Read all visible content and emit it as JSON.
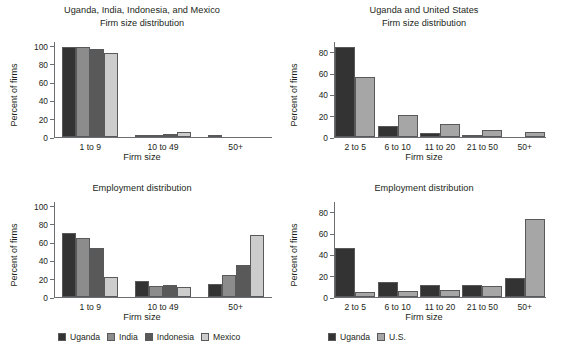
{
  "colors": {
    "uganda": "#333333",
    "india": "#8c8c8c",
    "indonesia": "#595959",
    "mexico": "#cccccc",
    "us": "#a6a6a6",
    "axis": "#6d6e71",
    "text": "#231f20",
    "background": "#ffffff"
  },
  "legends": {
    "four_country": {
      "items": [
        {
          "label": "Uganda",
          "color": "#333333"
        },
        {
          "label": "India",
          "color": "#8c8c8c"
        },
        {
          "label": "Indonesia",
          "color": "#595959"
        },
        {
          "label": "Mexico",
          "color": "#cccccc"
        }
      ]
    },
    "two_country": {
      "items": [
        {
          "label": "Uganda",
          "color": "#333333"
        },
        {
          "label": "U.S.",
          "color": "#a6a6a6"
        }
      ]
    }
  },
  "chart_data": [
    {
      "id": "top-left",
      "type": "bar",
      "title": "Uganda, India, Indonesia, and Mexico",
      "subtitle": "Firm size distribution",
      "xlabel": "Firm size",
      "ylabel": "Percent of firms",
      "ylim": [
        0,
        105
      ],
      "yticks": [
        0,
        20,
        40,
        60,
        80,
        100
      ],
      "grid": false,
      "legend_position": "bottom",
      "categories": [
        "1 to 9",
        "10 to 49",
        "50+"
      ],
      "series": [
        {
          "name": "Uganda",
          "color": "#333333",
          "values": [
            98,
            1.2,
            1.5
          ]
        },
        {
          "name": "India",
          "color": "#8c8c8c",
          "values": [
            98,
            1.2,
            0
          ]
        },
        {
          "name": "Indonesia",
          "color": "#595959",
          "values": [
            96,
            3,
            0
          ]
        },
        {
          "name": "Mexico",
          "color": "#cccccc",
          "values": [
            92,
            6,
            0
          ]
        }
      ]
    },
    {
      "id": "top-right",
      "type": "bar",
      "title": "Uganda and United States",
      "subtitle": "Firm size distribution",
      "xlabel": "Firm size",
      "ylabel": "Percent of firms",
      "ylim": [
        0,
        90
      ],
      "yticks": [
        0,
        20,
        40,
        60,
        80
      ],
      "grid": false,
      "legend_position": "bottom",
      "categories": [
        "2 to 5",
        "6 to 10",
        "11 to 20",
        "21 to 50",
        "50+"
      ],
      "series": [
        {
          "name": "Uganda",
          "color": "#333333",
          "values": [
            84,
            10,
            3.5,
            1.5,
            0
          ]
        },
        {
          "name": "U.S.",
          "color": "#a6a6a6",
          "values": [
            56,
            21,
            12.5,
            7,
            4.5
          ]
        }
      ]
    },
    {
      "id": "bottom-left",
      "type": "bar",
      "title": "Employment distribution",
      "subtitle": "",
      "xlabel": "Firm size",
      "ylabel": "Percent of firms",
      "ylim": [
        0,
        105
      ],
      "yticks": [
        0,
        20,
        40,
        60,
        80,
        100
      ],
      "grid": false,
      "legend_position": "bottom",
      "categories": [
        "1 to 9",
        "10 to 49",
        "50+"
      ],
      "series": [
        {
          "name": "Uganda",
          "color": "#333333",
          "values": [
            70,
            17,
            14
          ]
        },
        {
          "name": "India",
          "color": "#8c8c8c",
          "values": [
            65,
            12,
            24
          ]
        },
        {
          "name": "Indonesia",
          "color": "#595959",
          "values": [
            54,
            13,
            35
          ]
        },
        {
          "name": "Mexico",
          "color": "#cccccc",
          "values": [
            22,
            11,
            68
          ]
        }
      ]
    },
    {
      "id": "bottom-right",
      "type": "bar",
      "title": "Employment distribution",
      "subtitle": "",
      "xlabel": "Firm size",
      "ylabel": "Percent of firms",
      "ylim": [
        0,
        90
      ],
      "yticks": [
        0,
        20,
        40,
        60,
        80
      ],
      "grid": false,
      "legend_position": "bottom",
      "categories": [
        "2 to 5",
        "6 to 10",
        "11 to 20",
        "21 to 50",
        "50+"
      ],
      "series": [
        {
          "name": "Uganda",
          "color": "#333333",
          "values": [
            46,
            14,
            11.5,
            11,
            18
          ]
        },
        {
          "name": "U.S.",
          "color": "#a6a6a6",
          "values": [
            5,
            6,
            7,
            10,
            73
          ]
        }
      ]
    }
  ]
}
